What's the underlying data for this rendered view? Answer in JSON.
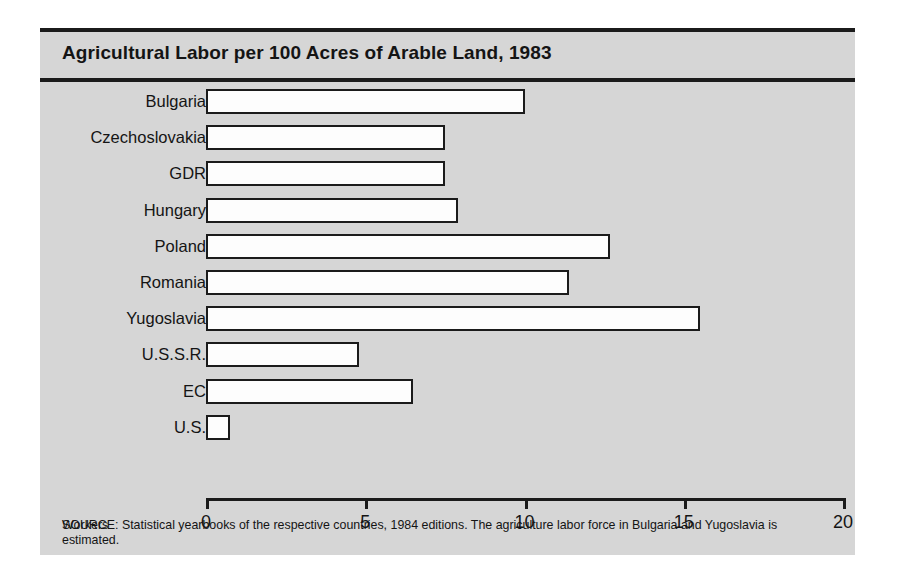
{
  "figure": {
    "title": "Agricultural Labor per 100 Acres of Arable Land, 1983",
    "axis_name": "Workers",
    "source": "SOURCE: Statistical yearbooks of the respective countries, 1984 editions. The agriculture labor force in Bulgaria and Yugoslavia is estimated.",
    "background_color": "#d6d6d6",
    "bar_fill_color": "#fdfdfd",
    "bar_outline_color": "#1b1b1b"
  },
  "chart_data": {
    "type": "bar",
    "orientation": "horizontal",
    "title": "Agricultural Labor per 100 Acres of Arable Land, 1983",
    "xlabel": "Workers",
    "ylabel": "",
    "categories": [
      "Bulgaria",
      "Czechoslovakia",
      "GDR",
      "Hungary",
      "Poland",
      "Romania",
      "Yugoslavia",
      "U.S.S.R.",
      "EC",
      "U.S."
    ],
    "values": [
      10.0,
      7.5,
      7.5,
      7.9,
      12.7,
      11.4,
      15.5,
      4.8,
      6.5,
      0.75
    ],
    "xlim": [
      0,
      20
    ],
    "xticks": [
      0,
      5,
      10,
      15,
      20
    ],
    "xtick_labels": [
      "0",
      "5",
      "10",
      "15",
      "20"
    ],
    "grid": false,
    "legend": false
  }
}
